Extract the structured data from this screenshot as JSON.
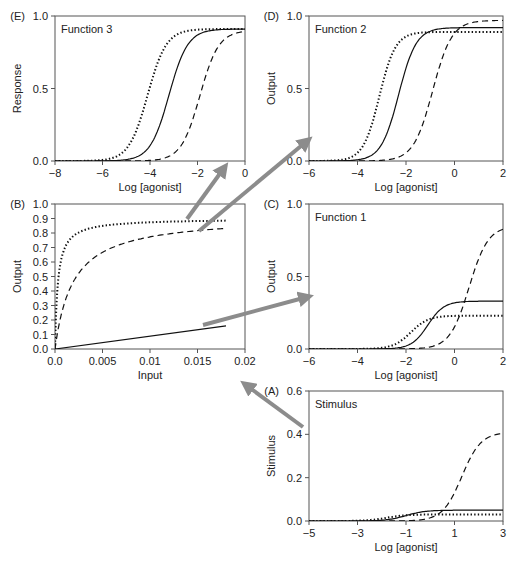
{
  "chart_data": [
    {
      "id": "E",
      "type": "line",
      "panel_label": "(E)",
      "title": "Function 3",
      "xlabel": "Log [agonist]",
      "ylabel": "Response",
      "xlim": [
        -8,
        0
      ],
      "ylim": [
        0,
        1
      ],
      "xticks": [
        -8,
        -6,
        -4,
        -2,
        0
      ],
      "xtick_labels": [
        "−8",
        "−6",
        "−4",
        "−2",
        "0"
      ],
      "yticks": [
        0,
        0.5,
        1
      ],
      "ytick_labels": [
        "0.0",
        "0.5",
        "1.0"
      ],
      "box": {
        "left": 55,
        "top": 16,
        "right": 245,
        "bottom": 161
      },
      "series": [
        {
          "name": "solid",
          "style": "solid",
          "max": 0.91,
          "ec50": -3.2,
          "slope": 1.1
        },
        {
          "name": "dotted",
          "style": "dotted",
          "max": 0.91,
          "ec50": -4.1,
          "slope": 1.1
        },
        {
          "name": "dashed",
          "style": "dashed",
          "max": 0.9,
          "ec50": -1.9,
          "slope": 1.1
        }
      ]
    },
    {
      "id": "D",
      "type": "line",
      "panel_label": "(D)",
      "title": "Function 2",
      "xlabel": "Log [agonist]",
      "ylabel": "Output",
      "xlim": [
        -6,
        2
      ],
      "ylim": [
        0,
        1
      ],
      "xticks": [
        -6,
        -4,
        -2,
        0,
        2
      ],
      "xtick_labels": [
        "−6",
        "−4",
        "−2",
        "0",
        "2"
      ],
      "yticks": [
        0,
        0.5,
        1
      ],
      "ytick_labels": [
        "0.0",
        "0.5",
        "1.0"
      ],
      "box": {
        "left": 309,
        "top": 16,
        "right": 503,
        "bottom": 161
      },
      "series": [
        {
          "name": "solid",
          "style": "solid",
          "max": 0.92,
          "ec50": -2.3,
          "slope": 1.2
        },
        {
          "name": "dotted",
          "style": "dotted",
          "max": 0.89,
          "ec50": -3.1,
          "slope": 1.3
        },
        {
          "name": "dashed",
          "style": "dashed",
          "max": 0.97,
          "ec50": -0.9,
          "slope": 1.1
        }
      ]
    },
    {
      "id": "B",
      "type": "line",
      "panel_label": "(B)",
      "title": "",
      "xlabel": "Input",
      "ylabel": "Output",
      "xlim": [
        0,
        0.02
      ],
      "ylim": [
        0,
        1
      ],
      "xticks": [
        0,
        0.005,
        0.01,
        0.015,
        0.02
      ],
      "xtick_labels": [
        "0.0",
        "0.005",
        "0.01",
        "0.015",
        "0.02"
      ],
      "yticks": [
        0,
        0.1,
        0.2,
        0.3,
        0.4,
        0.5,
        0.6,
        0.7,
        0.8,
        0.9,
        1.0
      ],
      "ytick_labels": [
        "0.0",
        "0.1",
        "0.2",
        "0.3",
        "0.4",
        "0.5",
        "0.6",
        "0.7",
        "0.8",
        "0.9",
        "1.0"
      ],
      "box": {
        "left": 55,
        "top": 204,
        "right": 245,
        "bottom": 349
      },
      "series": [
        {
          "name": "solid",
          "style": "solid",
          "kind": "linear",
          "x": [
            0,
            0.018
          ],
          "y": [
            0.0,
            0.16
          ]
        },
        {
          "name": "dotted",
          "style": "dotted",
          "kind": "hyperbola",
          "max": 0.9,
          "k": 0.0003,
          "xmax": 0.018
        },
        {
          "name": "dashed",
          "style": "dashed",
          "kind": "hyperbola",
          "max": 0.92,
          "k": 0.0019,
          "xmax": 0.018
        }
      ]
    },
    {
      "id": "C",
      "type": "line",
      "panel_label": "(C)",
      "title": "Function 1",
      "xlabel": "Log [agonist]",
      "ylabel": "Output",
      "xlim": [
        -6,
        2
      ],
      "ylim": [
        0,
        1
      ],
      "xticks": [
        -6,
        -4,
        -2,
        0,
        2
      ],
      "xtick_labels": [
        "−6",
        "−4",
        "−2",
        "0",
        "2"
      ],
      "yticks": [
        0,
        0.5,
        1
      ],
      "ytick_labels": [
        "0.0",
        "0.5",
        "1.0"
      ],
      "box": {
        "left": 309,
        "top": 204,
        "right": 503,
        "bottom": 349
      },
      "series": [
        {
          "name": "solid",
          "style": "solid",
          "max": 0.33,
          "ec50": -1.1,
          "slope": 1.3
        },
        {
          "name": "dotted",
          "style": "dotted",
          "max": 0.23,
          "ec50": -1.8,
          "slope": 1.2
        },
        {
          "name": "dashed",
          "style": "dashed",
          "max": 0.85,
          "ec50": 0.6,
          "slope": 1.1
        }
      ]
    },
    {
      "id": "A",
      "type": "line",
      "panel_label": "(A)",
      "title": "Stimulus",
      "xlabel": "Log [agonist]",
      "ylabel": "Stimulus",
      "xlim": [
        -5,
        3
      ],
      "ylim": [
        0,
        0.6
      ],
      "xticks": [
        -5,
        -3,
        -1,
        1,
        3
      ],
      "xtick_labels": [
        "−5",
        "−3",
        "−1",
        "1",
        "3"
      ],
      "yticks": [
        0,
        0.2,
        0.4,
        0.6
      ],
      "ytick_labels": [
        "0.0",
        "0.2",
        "0.4",
        "0.6"
      ],
      "box": {
        "left": 309,
        "top": 391,
        "right": 503,
        "bottom": 521
      },
      "series": [
        {
          "name": "solid",
          "style": "solid",
          "max": 0.05,
          "ec50": -1.0,
          "slope": 1.1
        },
        {
          "name": "dotted",
          "style": "dotted",
          "max": 0.03,
          "ec50": -1.8,
          "slope": 1.1
        },
        {
          "name": "dashed",
          "style": "dashed",
          "max": 0.41,
          "ec50": 1.3,
          "slope": 1.1
        }
      ]
    }
  ],
  "arrows": [
    {
      "from": [
        187,
        219
      ],
      "to": [
        224,
        168
      ]
    },
    {
      "from": [
        199,
        231
      ],
      "to": [
        307,
        141
      ]
    },
    {
      "from": [
        203,
        325
      ],
      "to": [
        307,
        297
      ]
    },
    {
      "from": [
        303,
        427
      ],
      "to": [
        246,
        385
      ]
    }
  ],
  "colors": {
    "curve": "#111111",
    "axis": "#555555",
    "arrow": "#8c8c8c",
    "text": "#222222"
  }
}
